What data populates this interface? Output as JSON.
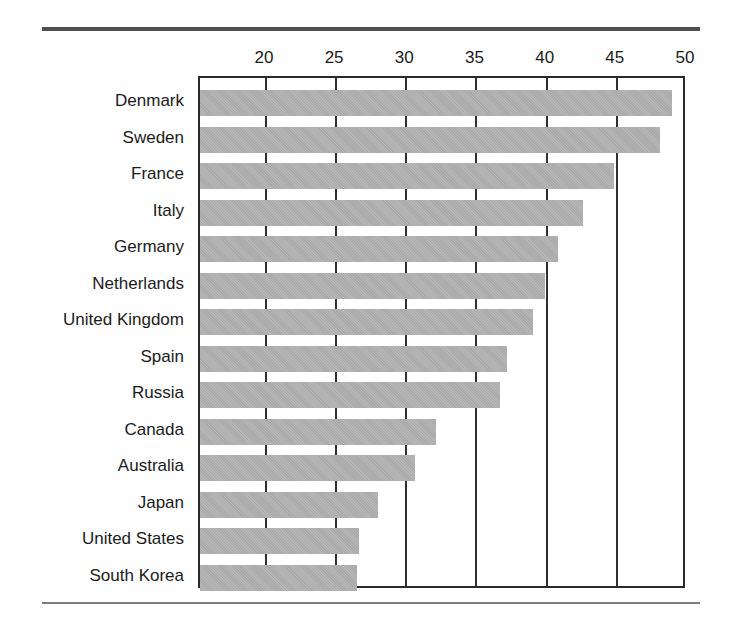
{
  "chart_data": {
    "type": "bar",
    "orientation": "horizontal",
    "title": "",
    "subtitle": "",
    "xlabel": "",
    "ylabel": "",
    "xlim": [
      15.3,
      50
    ],
    "ylim": null,
    "grid": true,
    "legend": null,
    "legend_position": "none",
    "xticks": [
      20,
      25,
      30,
      35,
      40,
      45,
      50
    ],
    "xtick_labels": [
      "20",
      "25",
      "30",
      "35",
      "40",
      "45",
      "50"
    ],
    "categories": [
      "Denmark",
      "Sweden",
      "France",
      "Italy",
      "Germany",
      "Netherlands",
      "United Kingdom",
      "Spain",
      "Russia",
      "Canada",
      "Australia",
      "Japan",
      "United States",
      "South Korea"
    ],
    "values": [
      48.9,
      48.1,
      44.8,
      42.6,
      40.8,
      39.9,
      39.0,
      37.2,
      36.7,
      32.1,
      30.6,
      28.0,
      26.6,
      26.5
    ],
    "bar_color": "#a9a9a9",
    "bar_edge_color": "#a9a9a9",
    "annotations": []
  },
  "style": {
    "axis_color": "#2a2a2a",
    "grid_color": "#2f2f2f",
    "text_color": "#1b1b1b",
    "rule_top_color": "#4f4f4f",
    "rule_bottom_color": "#7d7d7d",
    "background": "#fefefe"
  }
}
